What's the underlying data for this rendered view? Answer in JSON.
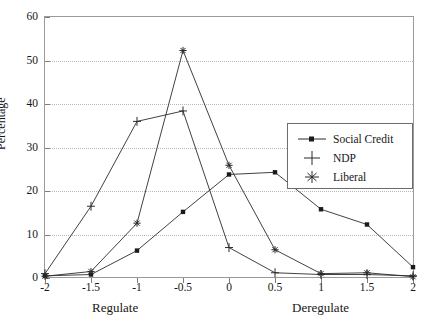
{
  "chart_data": {
    "type": "line",
    "title": "",
    "xlabel": "",
    "ylabel": "Percentage",
    "x": [
      -2,
      -1.5,
      -1,
      -0.5,
      0,
      0.5,
      1,
      1.5,
      2
    ],
    "xtick_labels": [
      "-2",
      "-1.5",
      "-1",
      "-0.5",
      "0",
      "0.5",
      "1",
      "1.5",
      "2"
    ],
    "ytick_labels": [
      "0",
      "10",
      "20",
      "30",
      "40",
      "50",
      "60"
    ],
    "yticks": [
      0,
      10,
      20,
      30,
      40,
      50,
      60
    ],
    "xlim": [
      -2,
      2
    ],
    "ylim": [
      0,
      60
    ],
    "grid": true,
    "legend_position": "center-right",
    "axis_annotations": {
      "left": "Regulate",
      "right": "Deregulate"
    },
    "series": [
      {
        "name": "Social Credit",
        "marker": "square-dot",
        "values": [
          0.5,
          0.8,
          6.3,
          15.2,
          23.8,
          24.3,
          15.8,
          12.3,
          2.5
        ]
      },
      {
        "name": "NDP",
        "marker": "plus",
        "values": [
          1.0,
          16.5,
          36.0,
          38.4,
          7.0,
          1.2,
          0.8,
          0.8,
          0.5
        ]
      },
      {
        "name": "Liberal",
        "marker": "asterisk",
        "values": [
          0.4,
          1.5,
          12.6,
          52.3,
          25.9,
          6.5,
          1.0,
          1.2,
          0.3
        ]
      }
    ]
  },
  "legend": {
    "items": [
      {
        "label": "Social Credit",
        "marker": "square-dot"
      },
      {
        "label": "NDP",
        "marker": "plus"
      },
      {
        "label": "Liberal",
        "marker": "asterisk"
      }
    ]
  },
  "colors": {
    "series_line": "#2b2b2b",
    "grid": "#b9b9b9",
    "frame": "#9a9a9a",
    "text": "#161616",
    "background": "#ffffff"
  }
}
